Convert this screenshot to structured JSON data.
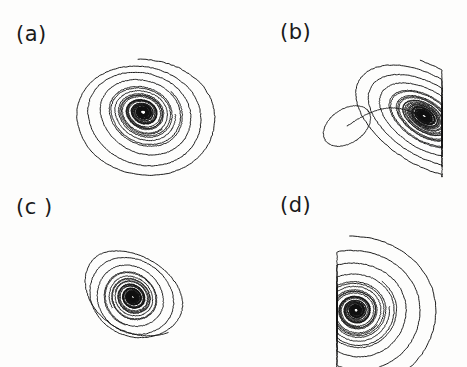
{
  "figure": {
    "width": 467,
    "height": 367,
    "background_color": "#fdfdfc",
    "ink_color": "#111111",
    "layout": "2x2 grid of phase-space portraits",
    "label_font_size_px": 21
  },
  "panels": [
    {
      "id": "a",
      "label": "(a)",
      "label_x": 16,
      "label_y": 24,
      "origin_x": 0,
      "origin_y": 0,
      "description": "Broad crescent-shaped strange attractor; outer loops sweep to a rounded point at lower left, dense black core at lower center-right."
    },
    {
      "id": "b",
      "label": "(b)",
      "label_x": 46,
      "label_y": 22,
      "origin_x": 234,
      "origin_y": 0,
      "description": "Angular attractor with sharp apex at upper right, flat vertical cut-off at right edge, dense horizontal band at bottom and an elongated detached loop extending to the left."
    },
    {
      "id": "c",
      "label": "(c )",
      "label_x": 16,
      "label_y": 13,
      "origin_x": 0,
      "origin_y": 184,
      "description": "Two-lobed butterfly attractor; open fan lobe to the upper left and a tapering wedge lobe to the lower right, joined at a dense dark center."
    },
    {
      "id": "d",
      "label": "(d)",
      "label_x": 46,
      "label_y": 11,
      "origin_x": 234,
      "origin_y": 184,
      "description": "Nested concentric spiral loops anchored on a sharp vertical left edge, expanding rightward into a rounded teardrop outline."
    }
  ],
  "chart_data": [
    {
      "type": "line",
      "id": "a",
      "title": "(a)",
      "xlabel": "",
      "ylabel": "",
      "grid": false,
      "legend": false,
      "axes_visible": false,
      "xlim": [
        0,
        233
      ],
      "ylim": [
        0,
        183
      ],
      "trajectory": {
        "kind": "logarithmic-spiral-crescent",
        "center_x": 143,
        "center_y": 112,
        "turns": 9.2,
        "theta_start": -1.35,
        "radius_start": 78,
        "radius_end": 4.5,
        "decay": 0.79,
        "skew_x": 0.0,
        "skew_y": 0.34,
        "squash_top": 0.86,
        "rotation_deg": -14,
        "tail_point_x": 88,
        "tail_point_y": 152,
        "apex_x": 160,
        "apex_y": 36,
        "bbox": [
          86,
          34,
          202,
          162
        ]
      }
    },
    {
      "type": "line",
      "id": "b",
      "title": "(b)",
      "xlabel": "",
      "ylabel": "",
      "grid": false,
      "legend": false,
      "axes_visible": false,
      "xlim": [
        0,
        233
      ],
      "ylim": [
        0,
        183
      ],
      "trajectory": {
        "kind": "sheared-spiral-with-detached-loop",
        "center_x": 190,
        "center_y": 116,
        "turns": 10.5,
        "theta_start": -1.1,
        "radius_start": 68,
        "radius_end": 3.5,
        "decay": 0.8,
        "skew_x": 0.52,
        "skew_y": 0.1,
        "squash_top": 0.92,
        "rotation_deg": -6,
        "clip_right_x": 208,
        "apex_x": 197,
        "apex_y": 42,
        "loop_center_x": 113,
        "loop_center_y": 126,
        "loop_rx": 26,
        "loop_ry": 17,
        "loop_rotation_deg": -34,
        "bbox": [
          86,
          40,
          209,
          160
        ]
      }
    },
    {
      "type": "line",
      "id": "c",
      "title": "(c )",
      "xlabel": "",
      "ylabel": "",
      "grid": false,
      "legend": false,
      "axes_visible": false,
      "xlim": [
        0,
        233
      ],
      "ylim": [
        0,
        183
      ],
      "trajectory": {
        "kind": "bilobed-butterfly-spiral",
        "center_x": 133,
        "center_y": 113,
        "turns": 9.8,
        "theta_start": 0.35,
        "radius_start": 60,
        "radius_end": 3.0,
        "decay": 0.81,
        "skew_x": -0.28,
        "skew_y": 0.52,
        "squash_top": 0.9,
        "rotation_deg": 28,
        "lobe_upper_left_x": 92,
        "lobe_upper_left_y": 66,
        "lobe_lower_right_x": 215,
        "lobe_lower_right_y": 122,
        "bbox": [
          88,
          48,
          216,
          160
        ]
      }
    },
    {
      "type": "line",
      "id": "d",
      "title": "(d)",
      "xlabel": "",
      "ylabel": "",
      "grid": false,
      "legend": false,
      "axes_visible": false,
      "xlim": [
        0,
        233
      ],
      "ylim": [
        0,
        183
      ],
      "trajectory": {
        "kind": "concentric-spiral-flat-left-edge",
        "center_x": 122,
        "center_y": 126,
        "turns": 9.6,
        "theta_start": -1.6,
        "radius_start": 84,
        "radius_end": 4.0,
        "decay": 0.815,
        "skew_x": 0.0,
        "skew_y": 0.06,
        "squash_top": 0.88,
        "rotation_deg": -3,
        "clip_left_x": 103,
        "apex_x": 128,
        "apex_y": 40,
        "bbox": [
          102,
          38,
          212,
          172
        ]
      }
    }
  ]
}
